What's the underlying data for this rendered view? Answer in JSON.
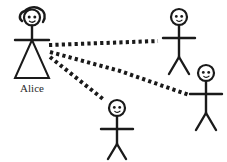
{
  "diagram": {
    "background_color": "#ffffff",
    "stroke_color": "#1a1a1a",
    "label_color": "#2b2b2b",
    "figures": [
      {
        "id": "alice",
        "label": "Alice",
        "role": "sender",
        "kind": "stick-figure-with-dress",
        "has_hair": true,
        "position": {
          "x": 31,
          "y": 45
        }
      },
      {
        "id": "person-top-right",
        "label": "",
        "role": "receiver",
        "kind": "stick-figure",
        "has_hair": false,
        "position": {
          "x": 179,
          "y": 40
        }
      },
      {
        "id": "person-right",
        "label": "",
        "role": "receiver",
        "kind": "stick-figure",
        "has_hair": false,
        "position": {
          "x": 206,
          "y": 94
        }
      },
      {
        "id": "person-bottom",
        "label": "",
        "role": "receiver",
        "kind": "stick-figure",
        "has_hair": false,
        "position": {
          "x": 117,
          "y": 112
        }
      }
    ],
    "connections": [
      {
        "id": "alice-to-top-right",
        "from": "alice",
        "to": "person-top-right",
        "style": "dotted",
        "thickness": 4
      },
      {
        "id": "alice-to-right",
        "from": "alice",
        "to": "person-right",
        "style": "dotted",
        "thickness": 4
      },
      {
        "id": "alice-to-bottom",
        "from": "alice",
        "to": "person-bottom",
        "style": "dotted",
        "thickness": 4
      }
    ]
  }
}
